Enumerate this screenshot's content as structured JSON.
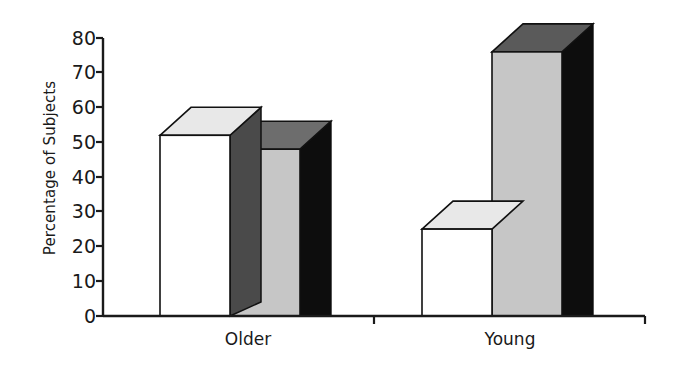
{
  "chart_data": {
    "type": "bar",
    "title": "",
    "subtitle": "",
    "xlabel": "",
    "ylabel": "Percentage of Subjects",
    "categories": [
      "Older",
      "Young"
    ],
    "series": [
      {
        "name": "series-1",
        "values": [
          52,
          25
        ],
        "color": "#ffffff"
      },
      {
        "name": "series-2",
        "values": [
          48,
          76
        ],
        "color": "#c6c6c6"
      }
    ],
    "ylim": [
      0,
      80
    ],
    "yticks": [
      0,
      10,
      20,
      30,
      40,
      50,
      60,
      70,
      80
    ],
    "ytick_labels": [
      "0",
      "10",
      "20",
      "30",
      "40",
      "50",
      "60",
      "70",
      "80"
    ],
    "grid": false,
    "legend": false,
    "legend_position": "none",
    "style": "3d-extruded-bars",
    "annotations": []
  },
  "axes": {
    "y_title": "Percentage of Subjects",
    "y_labels": [
      "80",
      "70",
      "60",
      "50",
      "40",
      "30",
      "20",
      "10",
      "0"
    ],
    "x_labels": [
      "Older",
      "Young"
    ]
  },
  "colors": {
    "bar_front_light": "#ffffff",
    "bar_front_gray": "#c6c6c6",
    "bar_top_light": "#e8e8e8",
    "bar_top_gray": "#8f8f8f",
    "bar_side_light": "#4a4a4a",
    "bar_side_dark": "#0d0d0d",
    "axis": "#1a1a1a",
    "text": "#1a1a1a",
    "background": "#ffffff"
  }
}
